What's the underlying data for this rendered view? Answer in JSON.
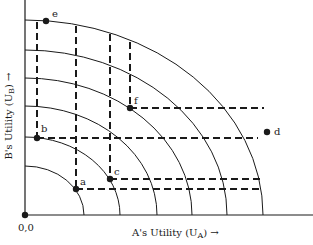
{
  "diagram": {
    "axes": {
      "x_label": "A's Utility (U",
      "x_label_sub": "A",
      "x_label_tail": ") →",
      "y_label": "B's Utility (U",
      "y_label_sub": "B",
      "y_label_tail": ") →",
      "origin_label": "0,0"
    },
    "curves_count": 6,
    "points": [
      {
        "label": "a",
        "x": 76,
        "y": 189
      },
      {
        "label": "b",
        "x": 37,
        "y": 138
      },
      {
        "label": "c",
        "x": 110,
        "y": 179
      },
      {
        "label": "d",
        "x": 268,
        "y": 132
      },
      {
        "label": "e",
        "x": 46,
        "y": 21
      },
      {
        "label": "f",
        "x": 130,
        "y": 108
      }
    ],
    "colors": {
      "ink": "#1a1a1a",
      "background": "#ffffff"
    }
  }
}
